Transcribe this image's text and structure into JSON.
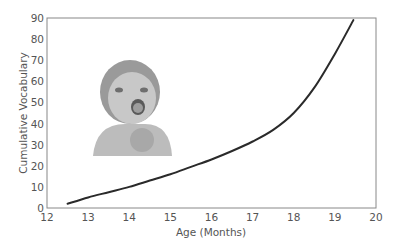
{
  "chart_data": {
    "type": "line",
    "title": "",
    "xlabel": "Age (Months)",
    "ylabel": "Cumulative Vocabulary",
    "xlim": [
      12,
      20
    ],
    "ylim": [
      0,
      90
    ],
    "xticks": [
      12,
      13,
      14,
      15,
      16,
      17,
      18,
      19,
      20
    ],
    "yticks": [
      0,
      10,
      20,
      30,
      40,
      50,
      60,
      70,
      80,
      90
    ],
    "grid": false,
    "legend": null,
    "series": [
      {
        "name": "Cumulative Vocabulary",
        "x": [
          12.5,
          13,
          13.5,
          14,
          14.5,
          15,
          15.5,
          16,
          16.5,
          17,
          17.5,
          18,
          18.5,
          19,
          19.45
        ],
        "y": [
          2,
          5,
          7.5,
          10,
          13,
          16,
          19.5,
          23,
          27,
          31.5,
          37,
          45,
          57,
          73,
          89
        ]
      }
    ],
    "annotations": [
      {
        "type": "image",
        "description": "laughing baby photo",
        "position": "upper-left inside plot"
      }
    ]
  },
  "colors": {
    "line": "#2a2a2a",
    "axis": "#888888",
    "text": "#555555"
  }
}
